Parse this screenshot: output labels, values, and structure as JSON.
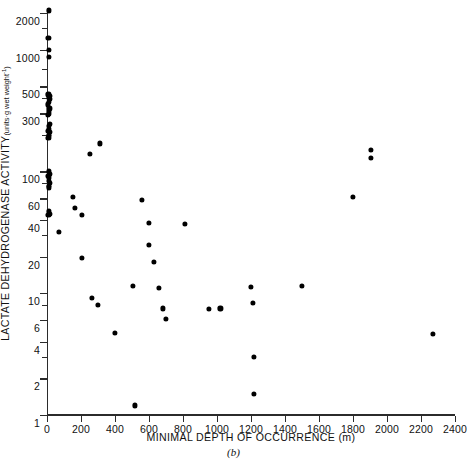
{
  "chart_data": {
    "type": "scatter",
    "title": "",
    "xlabel": "MINIMAL DEPTH OF OCCURRENCE (m)",
    "ylabel": "LACTATE DEHYDROGENASE ACTIVITY (units·g wet weight⁻¹)",
    "caption": "(b)",
    "xscale": "linear",
    "yscale": "log",
    "xlim": [
      0,
      2400
    ],
    "ylim": [
      1,
      2200
    ],
    "grid": false,
    "legend": null,
    "xticks": [
      0,
      200,
      400,
      600,
      800,
      1000,
      1200,
      1400,
      1600,
      1800,
      2000,
      2200,
      2400
    ],
    "xticklabels": [
      "0",
      "200",
      "400",
      "600",
      "800",
      "1000",
      "1200",
      "1400",
      "1600",
      "1800",
      "2000",
      "2200",
      "2400"
    ],
    "yticks": [
      1,
      2,
      4,
      6,
      10,
      20,
      40,
      60,
      100,
      300,
      500,
      1000,
      2000
    ],
    "yticklabels": [
      "1",
      "2",
      "4",
      "6",
      "10",
      "20",
      "40",
      "60",
      "100",
      "300",
      "500",
      "1000",
      "2000"
    ],
    "yminorticks": [
      3,
      8,
      30,
      80,
      200,
      400,
      700,
      1500
    ],
    "marker": "filled-circle",
    "marker_color": "#000000",
    "points": [
      {
        "x": 10,
        "y": 2100
      },
      {
        "x": 8,
        "y": 1250
      },
      {
        "x": 10,
        "y": 1000
      },
      {
        "x": 12,
        "y": 870
      },
      {
        "x": 8,
        "y": 430
      },
      {
        "x": 14,
        "y": 420
      },
      {
        "x": 9,
        "y": 400
      },
      {
        "x": 16,
        "y": 395
      },
      {
        "x": 10,
        "y": 370
      },
      {
        "x": 6,
        "y": 355
      },
      {
        "x": 14,
        "y": 330
      },
      {
        "x": 9,
        "y": 315
      },
      {
        "x": 12,
        "y": 300
      },
      {
        "x": 7,
        "y": 290
      },
      {
        "x": 15,
        "y": 245
      },
      {
        "x": 9,
        "y": 235
      },
      {
        "x": 12,
        "y": 225
      },
      {
        "x": 6,
        "y": 215
      },
      {
        "x": 16,
        "y": 210
      },
      {
        "x": 10,
        "y": 200
      },
      {
        "x": 13,
        "y": 195
      },
      {
        "x": 8,
        "y": 190
      },
      {
        "x": 11,
        "y": 100
      },
      {
        "x": 16,
        "y": 96
      },
      {
        "x": 8,
        "y": 92
      },
      {
        "x": 13,
        "y": 88
      },
      {
        "x": 10,
        "y": 84
      },
      {
        "x": 17,
        "y": 80
      },
      {
        "x": 9,
        "y": 76
      },
      {
        "x": 12,
        "y": 74
      },
      {
        "x": 10,
        "y": 47
      },
      {
        "x": 16,
        "y": 45
      },
      {
        "x": 8,
        "y": 44
      },
      {
        "x": 70,
        "y": 32
      },
      {
        "x": 150,
        "y": 62
      },
      {
        "x": 165,
        "y": 50
      },
      {
        "x": 205,
        "y": 44
      },
      {
        "x": 205,
        "y": 19.5
      },
      {
        "x": 250,
        "y": 140
      },
      {
        "x": 310,
        "y": 170
      },
      {
        "x": 262,
        "y": 9.2
      },
      {
        "x": 300,
        "y": 8.0
      },
      {
        "x": 400,
        "y": 4.7
      },
      {
        "x": 505,
        "y": 11.5
      },
      {
        "x": 515,
        "y": 1.2
      },
      {
        "x": 560,
        "y": 58
      },
      {
        "x": 600,
        "y": 38
      },
      {
        "x": 600,
        "y": 25
      },
      {
        "x": 630,
        "y": 18
      },
      {
        "x": 660,
        "y": 11.0
      },
      {
        "x": 680,
        "y": 7.5
      },
      {
        "x": 700,
        "y": 6.2
      },
      {
        "x": 810,
        "y": 37
      },
      {
        "x": 950,
        "y": 7.4
      },
      {
        "x": 1020,
        "y": 7.5
      },
      {
        "x": 1200,
        "y": 11.3
      },
      {
        "x": 1210,
        "y": 8.3
      },
      {
        "x": 1215,
        "y": 3.0
      },
      {
        "x": 1215,
        "y": 1.5
      },
      {
        "x": 1500,
        "y": 11.5
      },
      {
        "x": 1800,
        "y": 62
      },
      {
        "x": 1905,
        "y": 150
      },
      {
        "x": 1905,
        "y": 130
      },
      {
        "x": 2270,
        "y": 4.6
      }
    ]
  }
}
